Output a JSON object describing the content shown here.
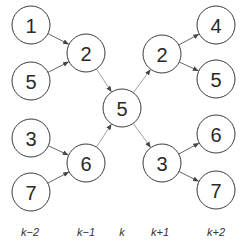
{
  "diagram": {
    "type": "tree-of-predecessors-successors",
    "center_node": {
      "id": "c",
      "label": "5"
    },
    "nodes": [
      {
        "id": "a1",
        "label": "1",
        "column": "k-2",
        "x": 31,
        "y": 25
      },
      {
        "id": "a2",
        "label": "5",
        "column": "k-2",
        "x": 31,
        "y": 81
      },
      {
        "id": "a3",
        "label": "3",
        "column": "k-2",
        "x": 31,
        "y": 138
      },
      {
        "id": "a4",
        "label": "7",
        "column": "k-2",
        "x": 31,
        "y": 192
      },
      {
        "id": "b1",
        "label": "2",
        "column": "k-1",
        "x": 86,
        "y": 53
      },
      {
        "id": "b2",
        "label": "6",
        "column": "k-1",
        "x": 86,
        "y": 163
      },
      {
        "id": "c",
        "label": "5",
        "column": "k",
        "x": 122,
        "y": 108
      },
      {
        "id": "d1",
        "label": "2",
        "column": "k+1",
        "x": 162,
        "y": 54
      },
      {
        "id": "d2",
        "label": "3",
        "column": "k+1",
        "x": 162,
        "y": 163
      },
      {
        "id": "e1",
        "label": "4",
        "column": "k+2",
        "x": 216,
        "y": 25
      },
      {
        "id": "e2",
        "label": "5",
        "column": "k+2",
        "x": 216,
        "y": 79
      },
      {
        "id": "e3",
        "label": "6",
        "column": "k+2",
        "x": 216,
        "y": 134
      },
      {
        "id": "e4",
        "label": "7",
        "column": "k+2",
        "x": 216,
        "y": 190
      }
    ],
    "edges": [
      {
        "from": "a1",
        "to": "b1"
      },
      {
        "from": "a2",
        "to": "b1"
      },
      {
        "from": "a3",
        "to": "b2"
      },
      {
        "from": "a4",
        "to": "b2"
      },
      {
        "from": "b1",
        "to": "c"
      },
      {
        "from": "b2",
        "to": "c"
      },
      {
        "from": "c",
        "to": "d1"
      },
      {
        "from": "c",
        "to": "d2"
      },
      {
        "from": "d1",
        "to": "e1"
      },
      {
        "from": "d1",
        "to": "e2"
      },
      {
        "from": "d2",
        "to": "e3"
      },
      {
        "from": "d2",
        "to": "e4"
      }
    ],
    "column_labels": [
      {
        "text": "k−2",
        "x": 30
      },
      {
        "text": "k−1",
        "x": 86
      },
      {
        "text": "k",
        "x": 122
      },
      {
        "text": "k+1",
        "x": 160
      },
      {
        "text": "k+2",
        "x": 216
      }
    ],
    "node_radius": 19
  }
}
